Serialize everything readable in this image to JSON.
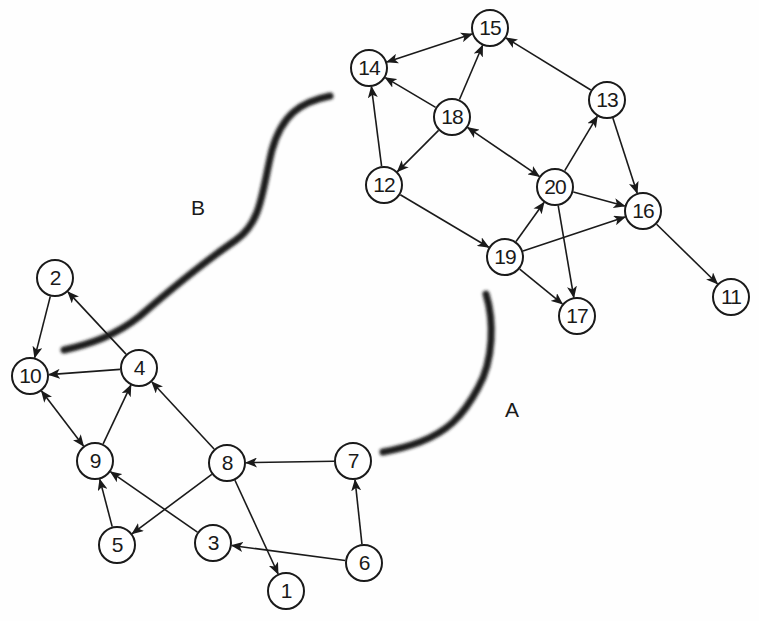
{
  "diagram": {
    "type": "directed-graph",
    "colors": {
      "edge": "#1a1a1a",
      "node_border": "#1a1a1a",
      "node_fill": "#ffffff",
      "cut_stroke": "#1c1c1c"
    },
    "nodes": [
      {
        "id": "1",
        "label": "1",
        "x": 286,
        "y": 591
      },
      {
        "id": "2",
        "label": "2",
        "x": 55,
        "y": 278
      },
      {
        "id": "3",
        "label": "3",
        "x": 213,
        "y": 543
      },
      {
        "id": "4",
        "label": "4",
        "x": 139,
        "y": 368
      },
      {
        "id": "5",
        "label": "5",
        "x": 117,
        "y": 545
      },
      {
        "id": "6",
        "label": "6",
        "x": 364,
        "y": 563
      },
      {
        "id": "7",
        "label": "7",
        "x": 353,
        "y": 461
      },
      {
        "id": "8",
        "label": "8",
        "x": 227,
        "y": 463
      },
      {
        "id": "9",
        "label": "9",
        "x": 95,
        "y": 461
      },
      {
        "id": "10",
        "label": "10",
        "x": 30,
        "y": 376
      },
      {
        "id": "11",
        "label": "11",
        "x": 731,
        "y": 297
      },
      {
        "id": "12",
        "label": "12",
        "x": 384,
        "y": 185
      },
      {
        "id": "13",
        "label": "13",
        "x": 607,
        "y": 100
      },
      {
        "id": "14",
        "label": "14",
        "x": 369,
        "y": 68
      },
      {
        "id": "15",
        "label": "15",
        "x": 490,
        "y": 28
      },
      {
        "id": "16",
        "label": "16",
        "x": 643,
        "y": 211
      },
      {
        "id": "17",
        "label": "17",
        "x": 577,
        "y": 316
      },
      {
        "id": "18",
        "label": "18",
        "x": 452,
        "y": 117
      },
      {
        "id": "19",
        "label": "19",
        "x": 505,
        "y": 257
      },
      {
        "id": "20",
        "label": "20",
        "x": 555,
        "y": 187
      }
    ],
    "edges": [
      {
        "from": "14",
        "to": "15",
        "both": true
      },
      {
        "from": "18",
        "to": "14",
        "both": false
      },
      {
        "from": "18",
        "to": "15",
        "both": false
      },
      {
        "from": "13",
        "to": "15",
        "both": false
      },
      {
        "from": "12",
        "to": "14",
        "both": false
      },
      {
        "from": "18",
        "to": "12",
        "both": false
      },
      {
        "from": "18",
        "to": "20",
        "both": true
      },
      {
        "from": "20",
        "to": "13",
        "both": false
      },
      {
        "from": "13",
        "to": "16",
        "both": false
      },
      {
        "from": "20",
        "to": "16",
        "both": false
      },
      {
        "from": "19",
        "to": "16",
        "both": false
      },
      {
        "from": "19",
        "to": "20",
        "both": false
      },
      {
        "from": "12",
        "to": "19",
        "both": false
      },
      {
        "from": "20",
        "to": "17",
        "both": false
      },
      {
        "from": "19",
        "to": "17",
        "both": false
      },
      {
        "from": "16",
        "to": "11",
        "both": false
      },
      {
        "from": "2",
        "to": "10",
        "both": false
      },
      {
        "from": "4",
        "to": "2",
        "both": false
      },
      {
        "from": "4",
        "to": "10",
        "both": false
      },
      {
        "from": "10",
        "to": "9",
        "both": true
      },
      {
        "from": "9",
        "to": "4",
        "both": false
      },
      {
        "from": "8",
        "to": "4",
        "both": false
      },
      {
        "from": "8",
        "to": "5",
        "both": false
      },
      {
        "from": "5",
        "to": "9",
        "both": false
      },
      {
        "from": "3",
        "to": "9",
        "both": false
      },
      {
        "from": "8",
        "to": "1",
        "both": false
      },
      {
        "from": "7",
        "to": "8",
        "both": false
      },
      {
        "from": "6",
        "to": "7",
        "both": false
      },
      {
        "from": "6",
        "to": "3",
        "both": false
      }
    ],
    "cuts": [
      {
        "name": "B",
        "label": "B",
        "label_x": 198,
        "label_y": 208,
        "path": "M 330 96 C 300 102, 282 115, 272 150 C 262 190, 262 222, 236 240 C 200 265, 170 290, 140 316 C 115 336, 90 344, 64 350"
      },
      {
        "name": "A",
        "label": "A",
        "label_x": 512,
        "label_y": 410,
        "path": "M 486 294 C 494 320, 494 360, 478 388 C 462 418, 446 432, 420 442 C 404 448, 394 450, 383 452"
      }
    ]
  }
}
